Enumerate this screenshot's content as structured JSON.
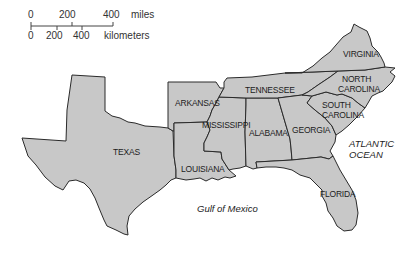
{
  "scale_bar": {
    "miles_ticks": [
      "0",
      "200",
      "400"
    ],
    "miles_unit": "miles",
    "km_ticks": [
      "0",
      "200",
      "400"
    ],
    "km_unit": "kilometers"
  },
  "states": [
    {
      "id": "texas",
      "label": "TEXAS"
    },
    {
      "id": "arkansas",
      "label": "ARKANSAS"
    },
    {
      "id": "louisiana",
      "label": "LOUISIANA"
    },
    {
      "id": "mississippi",
      "label": "MISSISSIPPI"
    },
    {
      "id": "alabama",
      "label": "ALABAMA"
    },
    {
      "id": "tennessee",
      "label": "TENNESSEE"
    },
    {
      "id": "georgia",
      "label": "GEORGIA"
    },
    {
      "id": "florida",
      "label": "FLORIDA"
    },
    {
      "id": "south-carolina",
      "label_line1": "SOUTH",
      "label_line2": "CAROLINA"
    },
    {
      "id": "north-carolina",
      "label_line1": "NORTH",
      "label_line2": "CAROLINA"
    },
    {
      "id": "virginia",
      "label": "VIRGINIA"
    }
  ],
  "water_bodies": {
    "gulf": "Gulf of Mexico",
    "atlantic_line1": "ATLANTIC",
    "atlantic_line2": "OCEAN"
  },
  "colors": {
    "land": "#c8c8c8",
    "border": "#2a2a2a",
    "background": "#ffffff"
  }
}
